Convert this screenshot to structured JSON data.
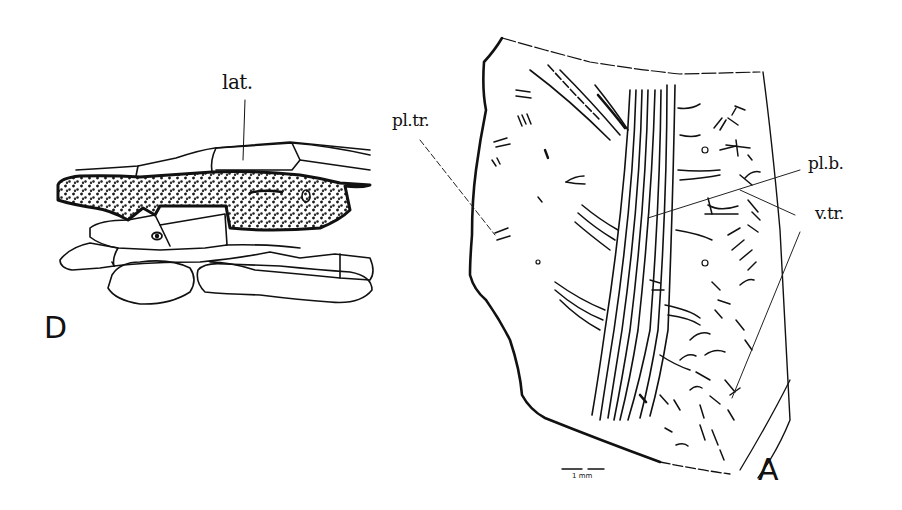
{
  "figure": {
    "panels": [
      {
        "id": "D",
        "letter": "D",
        "labels": {
          "lat": "lat."
        }
      },
      {
        "id": "A",
        "letter": "A",
        "labels": {
          "pltr": "pl.tr.",
          "plb": "pl.b.",
          "vtr": "v.tr."
        },
        "scale_bar": "1 mm"
      }
    ]
  }
}
